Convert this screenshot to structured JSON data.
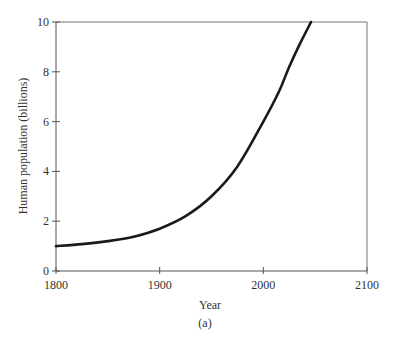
{
  "chart_data": {
    "type": "line",
    "title": "",
    "caption": "(a)",
    "xlabel": "Year",
    "ylabel": "Human population (billions)",
    "xlim": [
      1800,
      2100
    ],
    "ylim": [
      0,
      10
    ],
    "xticks": [
      1800,
      1900,
      2000,
      2100
    ],
    "yticks": [
      0,
      2,
      4,
      6,
      8,
      10
    ],
    "grid": false,
    "legend": null,
    "series": [
      {
        "name": "Human population",
        "color": "#1a1a1a",
        "x": [
          1800,
          1825,
          1850,
          1875,
          1900,
          1925,
          1950,
          1975,
          2000,
          2015,
          2025,
          2035,
          2046
        ],
        "y": [
          1.0,
          1.08,
          1.2,
          1.38,
          1.7,
          2.2,
          3.0,
          4.2,
          6.0,
          7.2,
          8.2,
          9.1,
          10.0
        ]
      }
    ]
  },
  "labels": {
    "xlabel": "Year",
    "ylabel": "Human population (billions)",
    "caption": "(a)",
    "xticks": [
      "1800",
      "1900",
      "2000",
      "2100"
    ],
    "yticks": [
      "0",
      "2",
      "4",
      "6",
      "8",
      "10"
    ]
  },
  "colors": {
    "axis": "#555555",
    "curve": "#1a1a1a",
    "text": "#333333"
  }
}
